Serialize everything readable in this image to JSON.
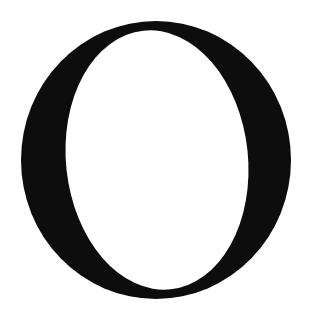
{
  "glyph": {
    "character": "O",
    "style": "serif capital letter",
    "fill_color": "#0d0d0d",
    "background_color": "#ffffff"
  }
}
